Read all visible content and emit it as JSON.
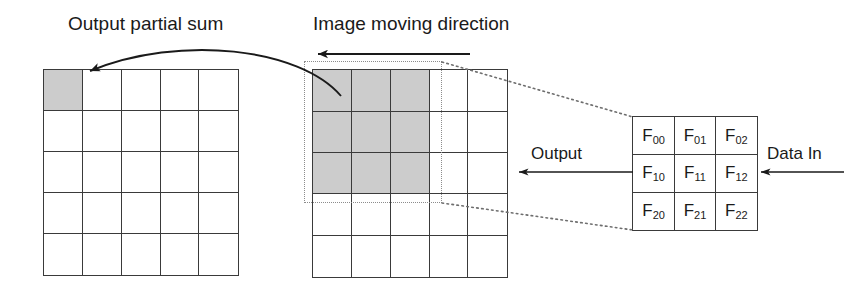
{
  "diagram": {
    "labels": {
      "output_partial_sum": "Output partial sum",
      "image_moving_direction": "Image moving direction",
      "output": "Output",
      "data_in": "Data In"
    },
    "colors": {
      "shade": "#cccccc",
      "stroke": "#3a3a3a",
      "dotted": "#8c8c8c",
      "background": "#ffffff",
      "text": "#1a1a1a"
    },
    "output_grid": {
      "name": "Output partial sum map",
      "rows": 5,
      "cols": 5,
      "shaded_cells": [
        [
          0,
          0
        ]
      ]
    },
    "image_grid": {
      "name": "Input image map",
      "rows": 5,
      "cols": 5,
      "shaded_region": {
        "row_start": 0,
        "col_start": 0,
        "rows": 3,
        "cols": 3
      }
    },
    "filter_grid": {
      "name": "Filter weight array",
      "rows": 3,
      "cols": 3,
      "cells": [
        {
          "base": "F",
          "sub": "00"
        },
        {
          "base": "F",
          "sub": "01"
        },
        {
          "base": "F",
          "sub": "02"
        },
        {
          "base": "F",
          "sub": "10"
        },
        {
          "base": "F",
          "sub": "11"
        },
        {
          "base": "F",
          "sub": "12"
        },
        {
          "base": "F",
          "sub": "20"
        },
        {
          "base": "F",
          "sub": "21"
        },
        {
          "base": "F",
          "sub": "22"
        }
      ]
    },
    "arrows": [
      {
        "name": "image-moving-direction-arrow",
        "direction": "left"
      },
      {
        "name": "output-partial-sum-arrow",
        "direction": "curved-left"
      },
      {
        "name": "output-arrow",
        "direction": "left"
      },
      {
        "name": "data-in-arrow",
        "direction": "left"
      }
    ],
    "connectors": [
      {
        "name": "selection-to-filter-top",
        "style": "dotted"
      },
      {
        "name": "selection-to-filter-bottom",
        "style": "dotted"
      }
    ]
  }
}
